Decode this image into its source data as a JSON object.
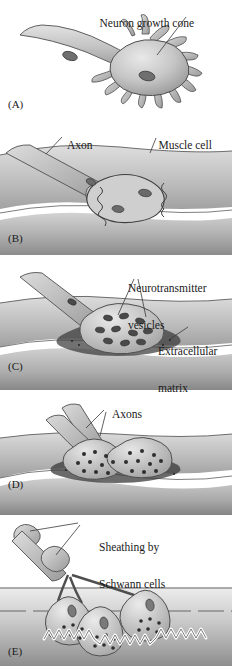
{
  "figure": {
    "background_color": "#ffffff",
    "ink_color": "#1a1a1a",
    "style": "grayscale airbrush biological illustration"
  },
  "palette": {
    "neuron_light": "#d8d8d8",
    "neuron_mid": "#b0b0b0",
    "neuron_dark": "#8a8a8a",
    "outline": "#4a4a4a",
    "muscle_light": "#d5d5d5",
    "muscle_mid": "#a8a8a8",
    "muscle_dark": "#7d7d7d",
    "highlight_white": "#ffffff",
    "vesicle": "#3a3a3a",
    "matrix": "#2e2e2e"
  },
  "panels": [
    {
      "letter": "(A)",
      "caption_stage": "Growth cone approaches muscle",
      "labels": [
        {
          "text": "Neuron growth cone",
          "lines": [
            "Neuron growth cone"
          ],
          "font_size": 11.5
        }
      ],
      "features": [
        "axon shaft",
        "nucleus",
        "growth cone",
        "filopodia"
      ]
    },
    {
      "letter": "(B)",
      "caption_stage": "Axon contacts muscle cell",
      "labels": [
        {
          "text": "Axon",
          "lines": [
            "Axon"
          ],
          "font_size": 11.5
        },
        {
          "text": "Muscle cell",
          "lines": [
            "Muscle cell"
          ],
          "font_size": 11.5
        }
      ],
      "features": [
        "axon",
        "muscle fiber",
        "contact plaque"
      ]
    },
    {
      "letter": "(C)",
      "caption_stage": "Vesicles and matrix accumulate",
      "labels": [
        {
          "text": "Neurotransmitter vesicles",
          "lines": [
            "Neurotransmitter",
            "vesicles"
          ],
          "font_size": 11.5
        },
        {
          "text": "Extracellular matrix",
          "lines": [
            "Extracellular",
            "matrix"
          ],
          "font_size": 11.5
        }
      ],
      "features": [
        "synaptic vesicles",
        "basal lamina",
        "synaptic cleft"
      ]
    },
    {
      "letter": "(D)",
      "caption_stage": "Multiple axons converge on one site",
      "labels": [
        {
          "text": "Axons",
          "lines": [
            "Axons"
          ],
          "font_size": 11.5
        }
      ],
      "features": [
        "two axons",
        "two terminal boutons",
        "extracellular matrix"
      ]
    },
    {
      "letter": "(E)",
      "caption_stage": "Mature junction with Schwann cell sheath",
      "labels": [
        {
          "text": "Sheathing by Schwann cells",
          "lines": [
            "Sheathing by",
            "Schwann cells"
          ],
          "font_size": 11.5
        }
      ],
      "features": [
        "myelinating Schwann cells",
        "three boutons",
        "junctional folds"
      ]
    }
  ]
}
